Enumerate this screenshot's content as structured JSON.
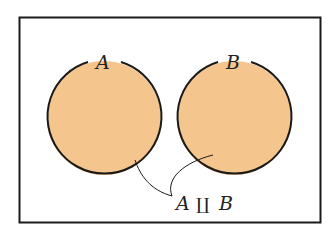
{
  "diagram": {
    "type": "venn",
    "colors": {
      "fill": "#f5c58e",
      "stroke": "#1a1a1a",
      "frame": "#1a1a1a",
      "background": "#ffffff"
    },
    "sets": [
      {
        "id": "A",
        "label": "A"
      },
      {
        "id": "B",
        "label": "B"
      }
    ],
    "annotation": {
      "left": "A",
      "operator": "∐",
      "right": "B"
    }
  }
}
